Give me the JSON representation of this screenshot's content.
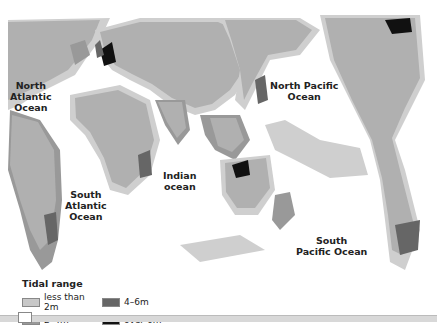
{
  "map": {
    "type": "world tidal range map",
    "ocean_labels": [
      {
        "id": "north-atlantic",
        "lines": [
          "North",
          "Atlantic",
          "Ocean"
        ]
      },
      {
        "id": "south-atlantic",
        "lines": [
          "South",
          "Atlantic",
          "Ocean"
        ]
      },
      {
        "id": "indian",
        "lines": [
          "Indian",
          "ocean"
        ]
      },
      {
        "id": "north-pacific",
        "lines": [
          "North Pacific",
          "Ocean"
        ]
      },
      {
        "id": "south-pacific",
        "lines": [
          "South",
          "Pacific Ocean"
        ]
      }
    ]
  },
  "legend": {
    "title": "Tidal range",
    "items": [
      {
        "label": "less than 2m",
        "color": "#c8c8c8"
      },
      {
        "label": "4–6m",
        "color": "#666666"
      },
      {
        "label": "2–4m",
        "color": "#999999"
      },
      {
        "label": "over 6m",
        "color": "#111111"
      }
    ]
  },
  "colors": {
    "land": "#b0b0b0",
    "coast_low": "#cfcfcf",
    "coast_mid": "#999999",
    "coast_high": "#666666",
    "coast_max": "#111111",
    "ocean": "#ffffff"
  }
}
